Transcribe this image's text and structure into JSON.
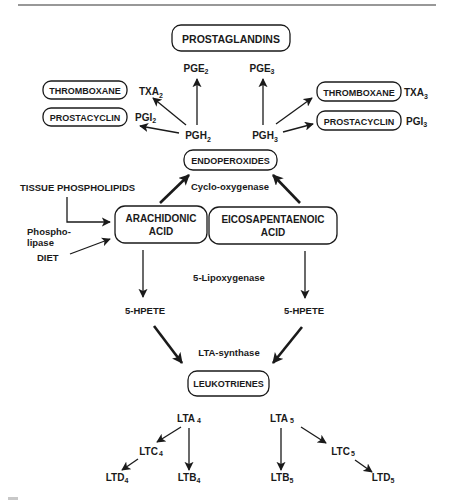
{
  "diagram": {
    "title_box": "PROSTAGLANDINS",
    "prostaglandins": {
      "pge_left": {
        "base": "PGE",
        "sub": "2"
      },
      "pge_right": {
        "base": "PGE",
        "sub": "3"
      }
    },
    "left_branch": {
      "thromboxane_box": "THROMBOXANE",
      "txa": {
        "base": "TXA",
        "sub": "2"
      },
      "prostacyclin_box": "PROSTACYCLIN",
      "pgi": {
        "base": "PGI",
        "sub": "2"
      },
      "pgh": {
        "base": "PGH",
        "sub": "2"
      }
    },
    "right_branch": {
      "thromboxane_box": "THROMBOXANE",
      "txa": {
        "base": "TXA",
        "sub": "3"
      },
      "prostacyclin_box": "PROSTACYCLIN",
      "pgi": {
        "base": "PGI",
        "sub": "3"
      },
      "pgh": {
        "base": "PGH",
        "sub": "3"
      }
    },
    "endoperoxides_box": "ENDOPEROXIDES",
    "cyclooxygenase_label": "Cyclo-oxygenase",
    "sources": {
      "tissue_phospholipids": "TISSUE PHOSPHOLIPIDS",
      "phospholipase_line1": "Phospho-",
      "phospholipase_line2": "lipase",
      "diet": "DIET"
    },
    "arachidonic_box": {
      "line1": "ARACHIDONIC",
      "line2": "ACID"
    },
    "eicosapentaenoic_box": {
      "line1": "EICOSAPENTAENOIC",
      "line2": "ACID"
    },
    "lipoxygenase_label": "5-Lipoxygenase",
    "hpete_left": "5-HPETE",
    "hpete_right": "5-HPETE",
    "lta_synthase_label": "LTA-synthase",
    "leukotrienes_box": "LEUKOTRIENES",
    "leukotrienes_left": {
      "lta": {
        "base": "LTA",
        "sub": "4"
      },
      "ltc": {
        "base": "LTC",
        "sub": "4"
      },
      "ltd": {
        "base": "LTD",
        "sub": "4"
      },
      "ltb": {
        "base": "LTB",
        "sub": "4"
      }
    },
    "leukotrienes_right": {
      "lta": {
        "base": "LTA",
        "sub": "5"
      },
      "ltb": {
        "base": "LTB",
        "sub": "5"
      },
      "ltc": {
        "base": "LTC",
        "sub": "5"
      },
      "ltd": {
        "base": "LTD",
        "sub": "5"
      }
    }
  },
  "colors": {
    "ink": "#1a1a1a",
    "background": "#ffffff"
  }
}
